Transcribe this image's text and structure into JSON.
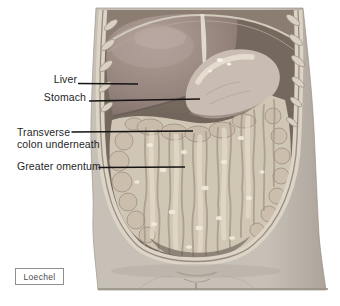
{
  "figure": {
    "labels": {
      "liver": "Liver",
      "stomach": "Stomach",
      "transverse_line1": "Transverse",
      "transverse_line2": "colon underneath",
      "greater_omentum": "Greater omentum"
    },
    "credit": "Loechel",
    "colors": {
      "background": "#ffffff",
      "skin": "#c6c0b7",
      "skin_shadow": "#b0a99f",
      "cavity": "#75695f",
      "rim": "#dcd5c7",
      "rim_line": "#998c7e",
      "diaphragm_region": "#8c7d73",
      "liver": "#97867f",
      "liver_highlight": "#b3a29b",
      "stomach": "#c9bcb2",
      "stomach_highlight": "#ece4d7",
      "omentum": "#cfc6b5",
      "omentum_streak": "#a39587",
      "omentum_highlight": "#f2ecdc",
      "colon_bulge": "#cabcab",
      "rib": "#d9d2c4",
      "label_text": "#1f1f1f",
      "leader_line": "#141414",
      "credit_text": "#4a4a4a",
      "credit_border": "#8f8f8f"
    }
  }
}
